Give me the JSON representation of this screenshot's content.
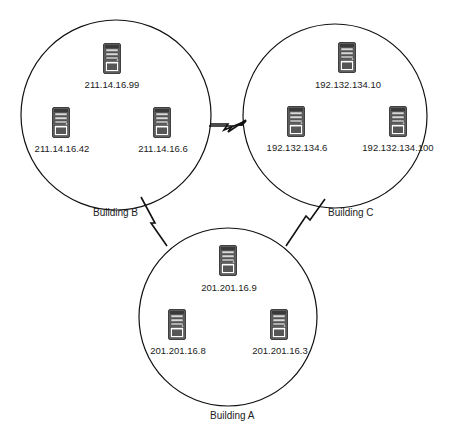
{
  "diagram": {
    "type": "network-topology",
    "buildings": [
      {
        "id": "B",
        "label": "Building B",
        "servers": [
          {
            "ip": "211.14.16.99",
            "icon": "server-tower-icon"
          },
          {
            "ip": "211.14.16.42",
            "icon": "server-tower-icon"
          },
          {
            "ip": "211.14.16.6",
            "icon": "server-tower-icon"
          }
        ]
      },
      {
        "id": "C",
        "label": "Building C",
        "servers": [
          {
            "ip": "192.132.134.10",
            "icon": "server-tower-icon"
          },
          {
            "ip": "192.132.134.6",
            "icon": "server-tower-icon"
          },
          {
            "ip": "192.132.134.100",
            "icon": "server-tower-icon"
          }
        ]
      },
      {
        "id": "A",
        "label": "Building A",
        "servers": [
          {
            "ip": "201.201.16.9",
            "icon": "server-tower-icon"
          },
          {
            "ip": "201.201.16.8",
            "icon": "server-tower-icon"
          },
          {
            "ip": "201.201.16.3",
            "icon": "server-tower-icon"
          }
        ]
      }
    ],
    "links": [
      {
        "from": "B",
        "to": "C",
        "style": "wan-lightning"
      },
      {
        "from": "B",
        "to": "A",
        "style": "wan-lightning"
      },
      {
        "from": "C",
        "to": "A",
        "style": "wan-lightning"
      }
    ],
    "colors": {
      "line": "#111111",
      "background": "#ffffff",
      "server_body": "#6b6b6b"
    }
  }
}
